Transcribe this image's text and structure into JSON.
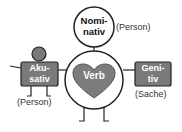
{
  "diagram": {
    "nominativ": {
      "line1": "Nomi-",
      "line2": "nativ",
      "note": "(Person)"
    },
    "verb": {
      "label": "Verb"
    },
    "akkusativ": {
      "line1": "Aku-",
      "line2": "sativ",
      "note": "(Person)"
    },
    "genitiv": {
      "line1": "Geni-",
      "line2": "tiv",
      "note": "(Sache)"
    },
    "colors": {
      "box_fill": "#7a7a7a",
      "heart_fill": "#7c7c7c",
      "stroke": "#222222",
      "box_text": "#ffffff"
    }
  }
}
